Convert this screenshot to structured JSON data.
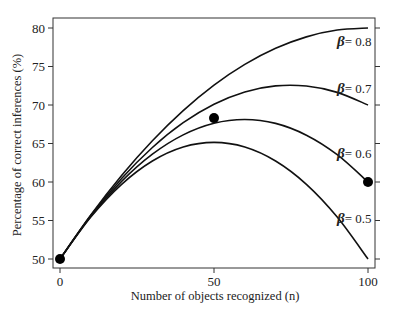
{
  "chart_data": {
    "type": "line",
    "title": "",
    "xlabel": "Number of objects recognized (n)",
    "ylabel": "Percentage of correct inferences (%)",
    "xlim": [
      0,
      100
    ],
    "ylim": [
      50,
      80
    ],
    "x_ticks": [
      0,
      50,
      100
    ],
    "y_ticks": [
      50,
      55,
      60,
      65,
      70,
      75,
      80
    ],
    "grid": false,
    "legend": "inline labels at right end of curves",
    "x": [
      0,
      10,
      20,
      30,
      40,
      50,
      60,
      70,
      80,
      90,
      100
    ],
    "series": [
      {
        "name": "β = 0.8",
        "symbol": "β",
        "value_label": "= 0.8",
        "values": [
          50,
          55.73,
          60.85,
          65.36,
          69.27,
          72.58,
          75.27,
          77.36,
          78.85,
          79.73,
          80
        ]
      },
      {
        "name": "β = 0.7",
        "symbol": "β",
        "value_label": "= 0.7",
        "values": [
          50,
          55.64,
          60.46,
          64.48,
          67.7,
          70.1,
          71.7,
          72.48,
          72.46,
          71.64,
          70
        ]
      },
      {
        "name": "β = 0.6",
        "symbol": "β",
        "value_label": "= 0.6",
        "values": [
          50,
          55.55,
          60.08,
          63.61,
          66.12,
          67.63,
          68.12,
          67.61,
          66.08,
          63.55,
          60
        ]
      },
      {
        "name": "β = 0.5",
        "symbol": "β",
        "value_label": "= 0.5",
        "values": [
          50,
          55.45,
          59.7,
          62.73,
          64.55,
          65.15,
          64.55,
          62.73,
          59.7,
          55.45,
          50
        ]
      }
    ],
    "markers": [
      {
        "x": 0,
        "y": 50
      },
      {
        "x": 50,
        "y": 68.3
      },
      {
        "x": 100,
        "y": 60
      }
    ],
    "label_positions": [
      {
        "series": 0,
        "x": 337,
        "y": 46
      },
      {
        "series": 1,
        "x": 337,
        "y": 93
      },
      {
        "series": 2,
        "x": 337,
        "y": 158
      },
      {
        "series": 3,
        "x": 337,
        "y": 223
      }
    ],
    "colors": {
      "line": "#111111",
      "frame": "#333333",
      "marker": "#000000"
    }
  }
}
